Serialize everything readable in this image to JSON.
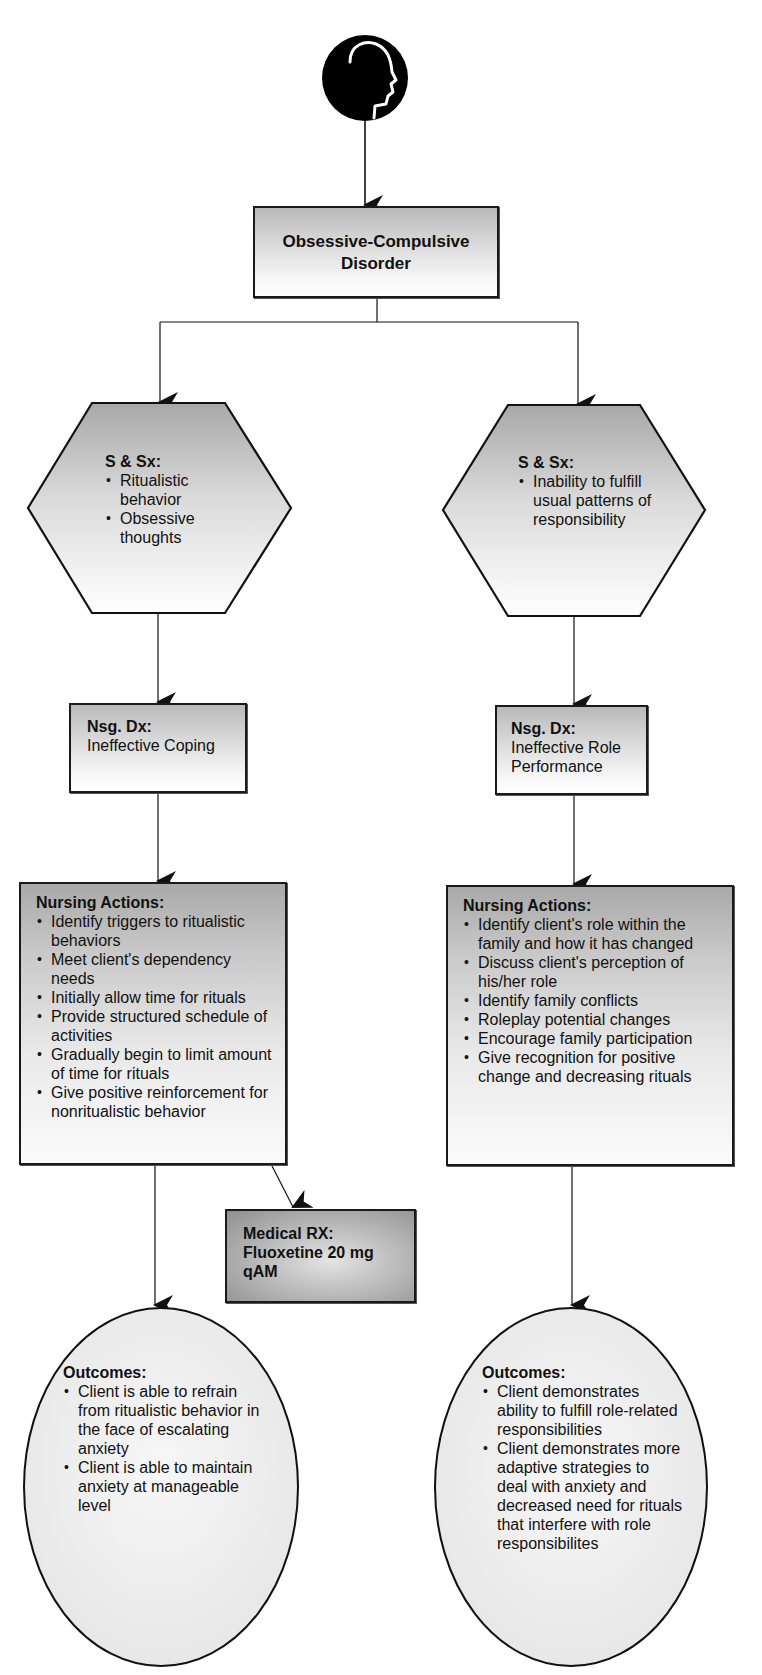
{
  "diagram": {
    "icon": "head-profile-icon",
    "root": {
      "title_line1": "Obsessive-Compulsive",
      "title_line2": "Disorder"
    },
    "left": {
      "signs": {
        "heading": "S & Sx:",
        "items": [
          "Ritualistic behavior",
          "Obsessive thoughts"
        ]
      },
      "nursing_dx": {
        "heading": "Nsg. Dx:",
        "text": "Ineffective Coping"
      },
      "nursing_actions": {
        "heading": "Nursing Actions:",
        "items": [
          "Identify triggers to ritualistic behaviors",
          "Meet client's dependency needs",
          "Initially allow time for rituals",
          "Provide structured schedule of activities",
          "Gradually begin to limit amount of time for rituals",
          "Give positive reinforcement for nonritualistic behavior"
        ]
      },
      "medical_rx": {
        "heading": "Medical RX:",
        "line1": "Fluoxetine 20 mg",
        "line2": "qAM"
      },
      "outcomes": {
        "heading": "Outcomes:",
        "items": [
          "Client is able to refrain from ritualistic behavior in the face of escalating anxiety",
          "Client is able to maintain anxiety at manageable level"
        ]
      }
    },
    "right": {
      "signs": {
        "heading": "S & Sx:",
        "items": [
          "Inability to fulfill usual patterns of responsibility"
        ]
      },
      "nursing_dx": {
        "heading": "Nsg. Dx:",
        "text": "Ineffective Role Performance"
      },
      "nursing_actions": {
        "heading": "Nursing Actions:",
        "items": [
          "Identify client's role within the family and how it has changed",
          "Discuss client's perception of his/her role",
          "Identify family conflicts",
          "Roleplay potential changes",
          "Encourage family participation",
          "Give recognition for positive change and decreasing rituals"
        ]
      },
      "outcomes": {
        "heading": "Outcomes:",
        "items": [
          "Client demonstrates ability to fulfill role-related responsibilities",
          "Client demonstrates more adaptive strategies to deal with anxiety and decreased need for rituals that interfere with role responsibilites"
        ]
      }
    },
    "colors": {
      "stroke": "#1a1a1a",
      "icon_fill": "#000000",
      "box_gradient_dark": "#b9b9b9",
      "box_gradient_light": "#ffffff",
      "rx_gradient_dark": "#8f8f8f",
      "oval_fill": "#f1f1f1"
    }
  }
}
